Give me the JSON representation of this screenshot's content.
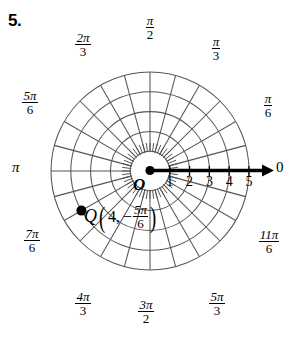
{
  "problem": {
    "number": "5."
  },
  "figure": {
    "type": "polar-grid",
    "center": {
      "x": 150,
      "y": 171
    },
    "unit_radius_px": 19.8,
    "circle_count": 5,
    "spoke_count": 24,
    "spoke_step_label": "pi/12",
    "colors": {
      "grid": "#4d4d4d",
      "axis": "#000000",
      "point": "#000000",
      "background": "#ffffff"
    },
    "polar_axis": {
      "label": "0",
      "direction_deg": 0,
      "arrow": true,
      "length_units": 5.9
    },
    "origin": {
      "label": "O"
    },
    "radial_ticks": [
      {
        "value": "1",
        "r": 1
      },
      {
        "value": "2",
        "r": 2
      },
      {
        "value": "3",
        "r": 3
      },
      {
        "value": "4",
        "r": 4
      },
      {
        "value": "5",
        "r": 5
      }
    ],
    "angle_labels": [
      {
        "id": "0",
        "num": "",
        "den": "",
        "plain": "0",
        "deg": 0
      },
      {
        "id": "pi6",
        "num": "π",
        "den": "6",
        "deg": 30
      },
      {
        "id": "pi3",
        "num": "π",
        "den": "3",
        "deg": 60
      },
      {
        "id": "pi2",
        "num": "π",
        "den": "2",
        "deg": 90
      },
      {
        "id": "2pi3",
        "num": "2π",
        "den": "3",
        "deg": 120
      },
      {
        "id": "5pi6",
        "num": "5π",
        "den": "6",
        "deg": 150
      },
      {
        "id": "pi",
        "num": "",
        "den": "",
        "plain": "π",
        "deg": 180
      },
      {
        "id": "7pi6",
        "num": "7π",
        "den": "6",
        "deg": 210
      },
      {
        "id": "4pi3",
        "num": "4π",
        "den": "3",
        "deg": 240
      },
      {
        "id": "3pi2",
        "num": "3π",
        "den": "2",
        "deg": 270
      },
      {
        "id": "5pi3",
        "num": "5π",
        "den": "3",
        "deg": 300
      },
      {
        "id": "11pi6",
        "num": "11π",
        "den": "6",
        "deg": 330
      }
    ],
    "plotted_point": {
      "name": "Q",
      "r_text": "4,",
      "sign": "−",
      "angle_num": "5π",
      "angle_den": "6",
      "r": 4,
      "theta_deg": -150,
      "pixel": {
        "x": 78,
        "y": 215
      }
    }
  }
}
